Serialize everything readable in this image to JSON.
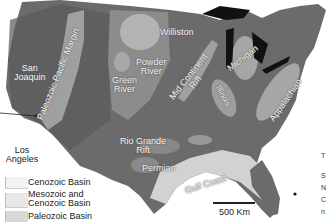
{
  "map": {
    "title": "Sedimentary basins of the contiguous United States",
    "colors": {
      "land": "#6e6e6e",
      "land_dark": "#585858",
      "paleozoic_basin": "#a3a3a3",
      "mesozoic_cenozoic_basin": "#c8c8c8",
      "cenozoic_basin": "#e4e4e4",
      "lakes": "#111111",
      "ocean": "#ffffff"
    },
    "basin_labels": [
      {
        "id": "san-joaquin",
        "lines": [
          "San",
          "Joaquin"
        ]
      },
      {
        "id": "paleozoic-pacific-margin",
        "lines": [
          "Paleozoic Pacific Margin"
        ]
      },
      {
        "id": "green-river",
        "lines": [
          "Green",
          "River"
        ]
      },
      {
        "id": "powder-river",
        "lines": [
          "Powder",
          "River"
        ]
      },
      {
        "id": "williston",
        "lines": [
          "Williston"
        ]
      },
      {
        "id": "mid-continent-rift",
        "lines": [
          "Mid Continent",
          "Rift"
        ]
      },
      {
        "id": "michigan",
        "lines": [
          "Michigan"
        ]
      },
      {
        "id": "illinois",
        "lines": [
          "Illinois"
        ]
      },
      {
        "id": "appalachian",
        "lines": [
          "Appalachian"
        ]
      },
      {
        "id": "rio-grande-rift",
        "lines": [
          "Rio Grande",
          "Rift"
        ]
      },
      {
        "id": "permian",
        "lines": [
          "Permian"
        ]
      },
      {
        "id": "gulf-coast",
        "lines": [
          "Gulf Coast"
        ]
      }
    ],
    "place_labels": [
      {
        "id": "los-angeles",
        "lines": [
          "Los",
          "Angeles"
        ]
      }
    ]
  },
  "legend": {
    "items": [
      {
        "label": "Cenozoic Basin",
        "color": "#ececec"
      },
      {
        "label_line1": "Mesozoic and",
        "label_line2": "Cenozoic Basin",
        "color": "#dcdcdc"
      },
      {
        "label": "Paleozoic Basin",
        "color": "#c4c4c4"
      }
    ]
  },
  "scale": {
    "label": "500 Km"
  },
  "right_margin_text": [
    "T",
    "S",
    "N",
    "C",
    "n"
  ]
}
